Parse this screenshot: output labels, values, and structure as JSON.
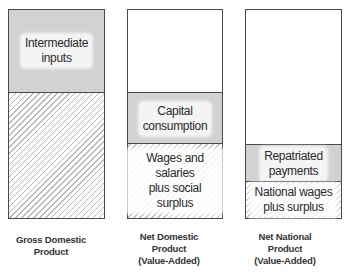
{
  "diagram": {
    "bars": [
      {
        "id": "gdp",
        "caption": [
          "Gross Domestic",
          "Product"
        ],
        "segments": [
          {
            "label": [
              "Intermediate",
              "inputs"
            ],
            "style": "gray"
          },
          {
            "label": [],
            "style": "hatch"
          }
        ]
      },
      {
        "id": "ndp",
        "caption": [
          "Net Domestic",
          "Product",
          "(Value-Added)"
        ],
        "segments": [
          {
            "label": [],
            "style": "white"
          },
          {
            "label": [
              "Capital",
              "consumption"
            ],
            "style": "gray"
          },
          {
            "label": [
              "Wages and salaries",
              "plus social",
              "surplus"
            ],
            "style": "hatch"
          }
        ]
      },
      {
        "id": "nnp",
        "caption": [
          "Net National",
          "Product",
          "(Value-Added)"
        ],
        "segments": [
          {
            "label": [],
            "style": "white"
          },
          {
            "label": [
              "Repatriated",
              "payments"
            ],
            "style": "gray"
          },
          {
            "label": [
              "National wages",
              "plus surplus"
            ],
            "style": "hatch"
          }
        ]
      }
    ],
    "colors": {
      "border": "#4a4a4a",
      "gray_fill": "#d2d2d2",
      "hatch_line": "#b8b8b8",
      "background": "#ffffff"
    }
  }
}
